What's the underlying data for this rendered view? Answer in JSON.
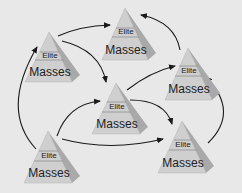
{
  "diagram": {
    "colors": {
      "background": "#e8e8e8",
      "pyramid_front": "#cfcfcf",
      "pyramid_side": "#a9a9a9",
      "divider": "#8f8f8f",
      "arrow": "#1a1a1a"
    },
    "pyramids": [
      {
        "id": "A",
        "elite": "Elite",
        "masses": "Masses"
      },
      {
        "id": "B",
        "elite": "Elite",
        "masses": "Masses"
      },
      {
        "id": "C",
        "elite": "Elite",
        "masses": "Masses"
      },
      {
        "id": "D",
        "elite": "Elite",
        "masses": "Masses"
      },
      {
        "id": "E",
        "elite": "Elite",
        "masses": "Masses"
      },
      {
        "id": "F",
        "elite": "Elite",
        "masses": "Masses"
      }
    ],
    "arrows": [
      {
        "from": "A",
        "to": "B"
      },
      {
        "from": "A",
        "to": "D"
      },
      {
        "from": "E",
        "to": "A"
      },
      {
        "from": "E",
        "to": "D"
      },
      {
        "from": "E",
        "to": "F"
      },
      {
        "from": "D",
        "to": "C"
      },
      {
        "from": "C",
        "to": "B"
      },
      {
        "from": "F",
        "to": "C"
      }
    ]
  }
}
